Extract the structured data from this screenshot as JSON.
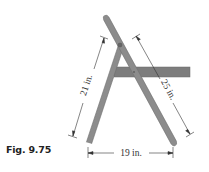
{
  "figure": {
    "caption": "Fig. 9.75"
  },
  "dimensions": {
    "front_leg": "21 in.",
    "back_leg": "25 in.",
    "base_span": "19 in."
  },
  "colors": {
    "member_fill": "#8c8c8c",
    "member_stroke": "#6e6e6e",
    "seat_fill": "#7d7d7d",
    "dimension_line": "#333333",
    "background": "#ffffff"
  }
}
